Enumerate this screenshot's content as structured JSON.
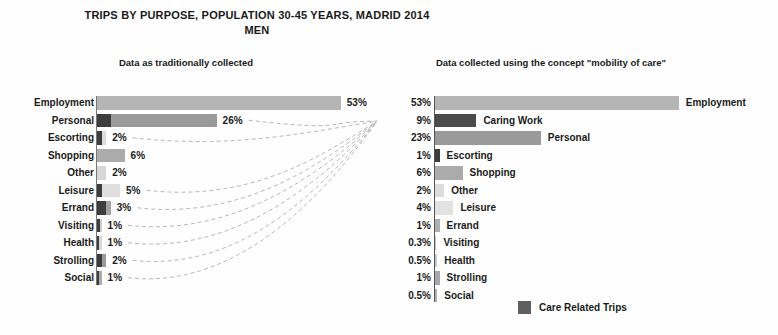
{
  "header": {
    "title": "TRIPS BY PURPOSE, POPULATION 30-45 YEARS, MADRID 2014",
    "subtitle": "MEN"
  },
  "legend": {
    "label": "Care Related Trips",
    "swatch_color": "#5f5f5f"
  },
  "colors": {
    "care_segment": "#3d3d3d",
    "caring_work_bar": "#4b4b4b",
    "connector_line": "#b8b8b8",
    "axis": "#555555",
    "text": "#1a1a1a"
  },
  "connectors": {
    "sources": [
      "Personal",
      "Escorting",
      "Leisure",
      "Errand",
      "Visiting",
      "Health",
      "Strolling",
      "Social"
    ],
    "target": "Caring Work",
    "style": "dashed"
  },
  "chart_data": [
    {
      "id": "traditional",
      "type": "bar",
      "orientation": "horizontal",
      "title": "Data as traditionally collected",
      "unit": "percent",
      "xlim": [
        0,
        60
      ],
      "rows": [
        {
          "label": "Employment",
          "value": 53,
          "display": "53%",
          "care_value": 0,
          "color": "#b5b5b5"
        },
        {
          "label": "Personal",
          "value": 26,
          "display": "26%",
          "care_value": 3,
          "color": "#9a9a9a"
        },
        {
          "label": "Escorting",
          "value": 2,
          "display": "2%",
          "care_value": 1,
          "color": "#dcdcdc"
        },
        {
          "label": "Shopping",
          "value": 6,
          "display": "6%",
          "care_value": 0,
          "color": "#ababab"
        },
        {
          "label": "Other",
          "value": 2,
          "display": "2%",
          "care_value": 0,
          "color": "#d6d6d6"
        },
        {
          "label": "Leisure",
          "value": 5,
          "display": "5%",
          "care_value": 1,
          "color": "#dedede"
        },
        {
          "label": "Errand",
          "value": 3,
          "display": "3%",
          "care_value": 2,
          "color": "#a2a2a2"
        },
        {
          "label": "Visiting",
          "value": 1,
          "display": "1%",
          "care_value": 0.7,
          "color": "#cfcfcf"
        },
        {
          "label": "Health",
          "value": 1,
          "display": "1%",
          "care_value": 0.5,
          "color": "#d8d8d8"
        },
        {
          "label": "Strolling",
          "value": 2,
          "display": "2%",
          "care_value": 1,
          "color": "#9a9a9a"
        },
        {
          "label": "Social",
          "value": 1,
          "display": "1%",
          "care_value": 0.5,
          "color": "#ababab"
        }
      ]
    },
    {
      "id": "mobility_of_care",
      "type": "bar",
      "orientation": "horizontal",
      "title": "Data collected using the concept \"mobility of care\"",
      "unit": "percent",
      "xlim": [
        0,
        60
      ],
      "rows": [
        {
          "label": "Employment",
          "value": 53,
          "display": "53%",
          "color": "#b5b5b5"
        },
        {
          "label": "Caring Work",
          "value": 9,
          "display": "9%",
          "color": "#4b4b4b"
        },
        {
          "label": "Personal",
          "value": 23,
          "display": "23%",
          "color": "#9a9a9a"
        },
        {
          "label": "Escorting",
          "value": 1,
          "display": "1%",
          "color": "#3d3d3d"
        },
        {
          "label": "Shopping",
          "value": 6,
          "display": "6%",
          "color": "#ababab"
        },
        {
          "label": "Other",
          "value": 2,
          "display": "2%",
          "color": "#dcdcdc"
        },
        {
          "label": "Leisure",
          "value": 4,
          "display": "4%",
          "color": "#e2e2e2"
        },
        {
          "label": "Errand",
          "value": 1,
          "display": "1%",
          "color": "#b0b0b0"
        },
        {
          "label": "Visiting",
          "value": 0.3,
          "display": "0.3%",
          "color": "#c4c4c4"
        },
        {
          "label": "Health",
          "value": 0.5,
          "display": "0.5%",
          "color": "#c9c9c9"
        },
        {
          "label": "Strolling",
          "value": 1,
          "display": "1%",
          "color": "#a8a8a8"
        },
        {
          "label": "Social",
          "value": 0.5,
          "display": "0.5%",
          "color": "#b0b0b0"
        }
      ]
    }
  ]
}
